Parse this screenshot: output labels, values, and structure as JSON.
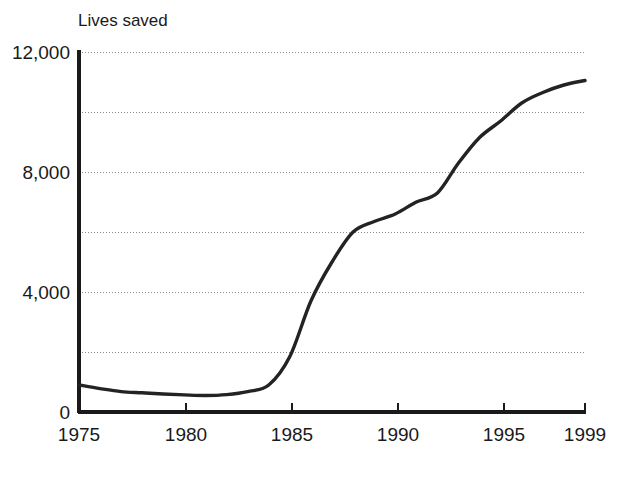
{
  "chart_data": {
    "type": "line",
    "title": "",
    "xlabel": "",
    "ylabel": "Lives saved",
    "ylabel_position": "top-left",
    "grid": true,
    "grid_axis": "y",
    "legend": "none",
    "xlim": [
      1975,
      1999
    ],
    "ylim": [
      0,
      12000
    ],
    "x_ticks": [
      1975,
      1980,
      1985,
      1990,
      1995,
      1999
    ],
    "x_tick_labels": [
      "1975",
      "1980",
      "1985",
      "1990",
      "1995",
      "1999"
    ],
    "y_ticks": [
      0,
      4000,
      8000,
      12000
    ],
    "y_tick_labels": [
      "0",
      "4,000",
      "8,000",
      "12,000"
    ],
    "y_gridlines": [
      2000,
      4000,
      6000,
      8000,
      10000,
      12000
    ],
    "line_color": "#232323",
    "grid_color": "#8c8c8c",
    "axis_color": "#1a1a1a",
    "background_color": "#ffffff",
    "series": [
      {
        "name": "Lives saved",
        "x": [
          1975,
          1976,
          1977,
          1978,
          1979,
          1980,
          1981,
          1982,
          1983,
          1984,
          1985,
          1986,
          1987,
          1988,
          1989,
          1990,
          1991,
          1992,
          1993,
          1994,
          1995,
          1996,
          1997,
          1998,
          1999
        ],
        "values": [
          900,
          780,
          680,
          640,
          600,
          570,
          550,
          580,
          680,
          900,
          1850,
          3700,
          5000,
          6000,
          6350,
          6600,
          7000,
          7300,
          8300,
          9150,
          9700,
          10300,
          10650,
          10900,
          11050
        ]
      }
    ]
  },
  "axis": {
    "y_title": "Lives saved"
  }
}
